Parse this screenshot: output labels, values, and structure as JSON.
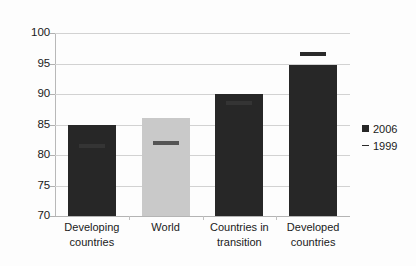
{
  "chart_data": {
    "type": "bar",
    "title": "",
    "xlabel": "",
    "ylabel": "",
    "ylim": [
      70,
      100
    ],
    "yticks": [
      70,
      75,
      80,
      85,
      90,
      95,
      100
    ],
    "ytick_labels": [
      "70",
      "75",
      "80",
      "85",
      "90",
      "95",
      "100"
    ],
    "grid": true,
    "legend_position": "right",
    "categories": [
      "Developing countries",
      "World",
      "Countries in transition",
      "Developed countries"
    ],
    "category_lines": [
      [
        "Developing",
        "countries"
      ],
      [
        "World"
      ],
      [
        "Countries in",
        "transition"
      ],
      [
        "Developed",
        "countries"
      ]
    ],
    "series": [
      {
        "name": "2006",
        "render": "bar",
        "values": [
          85.0,
          86.0,
          90.0,
          94.8
        ],
        "colors": [
          "#272727",
          "#c9c9c9",
          "#272727",
          "#272727"
        ]
      },
      {
        "name": "1999",
        "render": "dash-marker",
        "values": [
          81.5,
          82.0,
          88.5,
          96.5
        ]
      }
    ]
  },
  "legend": {
    "items": [
      {
        "label": "2006",
        "marker": "filled-square",
        "color": "#272727"
      },
      {
        "label": "1999",
        "marker": "dash",
        "color": "#2a2a2a"
      }
    ]
  },
  "colors": {
    "bar_dark": "#272727",
    "bar_light": "#c9c9c9",
    "gridline": "#d2d2d2",
    "axis": "#b8b8b8",
    "text": "#1a1a1a",
    "background": "#fdfdfd"
  }
}
